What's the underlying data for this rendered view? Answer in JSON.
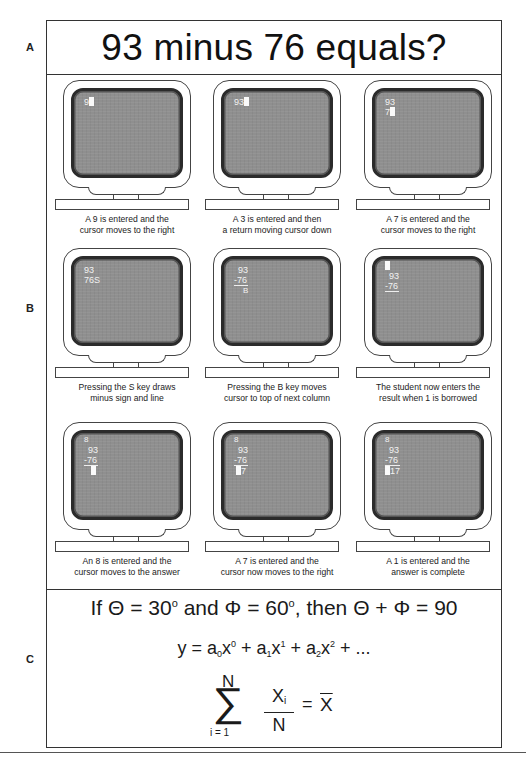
{
  "section_labels": {
    "a": "A",
    "b": "B",
    "c": "C"
  },
  "header": {
    "title": "93 minus 76 equals?"
  },
  "panels": [
    {
      "screen_lines": [
        "9"
      ],
      "cursor_line": 0,
      "caption_line1": "A 9 is entered and the",
      "caption_line2": "cursor moves to the right"
    },
    {
      "screen_lines": [
        "93"
      ],
      "cursor_line": 0,
      "caption_line1": "A 3 is entered and then",
      "caption_line2": "a return moving cursor down"
    },
    {
      "screen_lines": [
        "93",
        "7"
      ],
      "cursor_line": 1,
      "caption_line1": "A 7 is entered and the",
      "caption_line2": "cursor moves to the right"
    },
    {
      "screen_lines": [
        "93",
        "76S"
      ],
      "cursor_line": -1,
      "caption_line1": "Pressing the S key draws",
      "caption_line2": "minus sign and line"
    },
    {
      "screen_lines": [
        "93",
        "-76",
        "B"
      ],
      "cursor_line": -1,
      "caption_line1": "Pressing the B key moves",
      "caption_line2": "cursor to top of next column"
    },
    {
      "screen_lines": [
        "",
        "93",
        "-76"
      ],
      "cursor_line": 0,
      "caption_line1": "The student now enters the",
      "caption_line2": "result when 1 is borrowed"
    },
    {
      "screen_lines": [
        "8",
        "93",
        "-76",
        ""
      ],
      "cursor_line": 3,
      "caption_line1": "An 8 is entered and the",
      "caption_line2": "cursor moves to the answer"
    },
    {
      "screen_lines": [
        "8",
        "93",
        "-76",
        "7"
      ],
      "cursor_line": 3,
      "caption_line1": "A 7 is entered and the",
      "caption_line2": "cursor now moves to the right"
    },
    {
      "screen_lines": [
        "8",
        "93",
        "-76",
        "17"
      ],
      "cursor_line": 3,
      "caption_line1": "A 1 is entered and the",
      "caption_line2": "answer is complete"
    }
  ],
  "equations": {
    "eq1": {
      "if": "If",
      "theta": "Θ",
      "eq30": "= 30",
      "deg": "o",
      "and": "and",
      "phi": "Φ",
      "eq60": "= 60",
      "then": ", then",
      "plus": "+",
      "result": "= 90"
    },
    "eq2": {
      "y": "y = a",
      "s0": "0",
      "x0": "x",
      "p0": "0",
      "plus1": " + a",
      "s1": "1",
      "x1": "x",
      "p1": "1",
      "plus2": " + a",
      "s2": "2",
      "x2": "x",
      "p2": "2",
      "tail": " + ..."
    },
    "eq3": {
      "upper": "N",
      "sigma": "∑",
      "lower": "i = 1",
      "num": "X",
      "num_sub": "i",
      "den": "N",
      "equals": "=",
      "mean": "X"
    }
  }
}
